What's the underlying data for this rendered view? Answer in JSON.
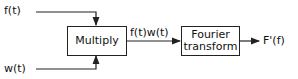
{
  "diagram": {
    "inputs": [
      {
        "id": "f",
        "label": "f(t)"
      },
      {
        "id": "w",
        "label": "w(t)"
      }
    ],
    "blocks": [
      {
        "id": "multiply",
        "label": "Multiply"
      },
      {
        "id": "fourier",
        "label_line1": "Fourier",
        "label_line2": "transform"
      }
    ],
    "intermediate_label": "f(t)w(t)",
    "output_label": "F'(f)",
    "colors": {
      "stroke": "#222222",
      "background": "#ffffff"
    }
  }
}
